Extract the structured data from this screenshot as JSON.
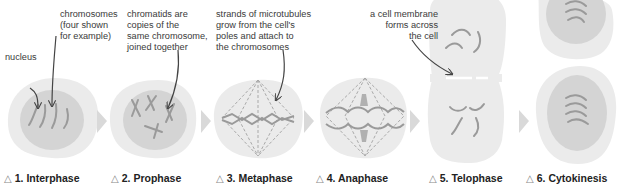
{
  "colors": {
    "cell_outer": "#ebebeb",
    "nucleus": "#d4d4d4",
    "chromosome": "#9a9a9a",
    "spindle": "#a9a9a9",
    "stage_arrow": "#d9d9d9",
    "pointer": "#444444",
    "membrane": "#ffffff"
  },
  "annotations": [
    {
      "id": "nucleus",
      "text": "nucleus"
    },
    {
      "id": "chromosomes",
      "text": "chromosomes\n(four shown\nfor example)"
    },
    {
      "id": "chromatids",
      "text": "chromatids are\ncopies of the\nsame chromosome,\njoined together"
    },
    {
      "id": "microtubules",
      "text": "strands of microtubules\ngrow from the cell's\npoles and attach to\nthe chromosomes"
    },
    {
      "id": "membrane",
      "text": "a cell membrane\nforms across\nthe cell"
    }
  ],
  "stages": [
    {
      "number": "1.",
      "name": "Interphase",
      "marker": "△"
    },
    {
      "number": "2.",
      "name": "Prophase",
      "marker": "△"
    },
    {
      "number": "3.",
      "name": "Metaphase",
      "marker": "△"
    },
    {
      "number": "4.",
      "name": "Anaphase",
      "marker": "△"
    },
    {
      "number": "5.",
      "name": "Telophase",
      "marker": "△"
    },
    {
      "number": "6.",
      "name": "Cytokinesis",
      "marker": "△"
    }
  ]
}
